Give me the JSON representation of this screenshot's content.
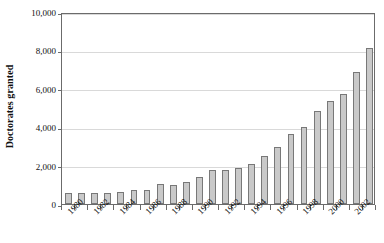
{
  "chart_data": {
    "type": "bar",
    "title": "",
    "subtitle": "",
    "xlabel": "",
    "ylabel": "Doctorates granted",
    "ylim": [
      0,
      10000
    ],
    "ytick_values": [
      0,
      2000,
      4000,
      6000,
      8000,
      10000
    ],
    "ytick_labels": [
      "0",
      "2,000",
      "4,000",
      "6,000",
      "8,000",
      "10,000"
    ],
    "grid": true,
    "legend": null,
    "legend_position": "none",
    "bar_color": "#c9c9c9",
    "bar_edge_color": "#787878",
    "gridline_color": "#d9d9d9",
    "axis_color": "#6b6b6b",
    "categories": [
      "1980",
      "1981",
      "1982",
      "1983",
      "1984",
      "1985",
      "1986",
      "1987",
      "1988",
      "1989",
      "1990",
      "1991",
      "1992",
      "1993",
      "1994",
      "1995",
      "1996",
      "1997",
      "1998",
      "1999",
      "2000",
      "2001",
      "2002",
      "2003"
    ],
    "xtick_labels": [
      "1980",
      "1982",
      "1984",
      "1986",
      "1988",
      "1990",
      "1992",
      "1994",
      "1996",
      "1998",
      "2000",
      "2002"
    ],
    "values": [
      560,
      555,
      560,
      585,
      640,
      730,
      740,
      1050,
      1010,
      1160,
      1430,
      1790,
      1780,
      1890,
      2070,
      2480,
      2950,
      3630,
      4000,
      4820,
      5340,
      5730,
      6900,
      8100
    ]
  }
}
